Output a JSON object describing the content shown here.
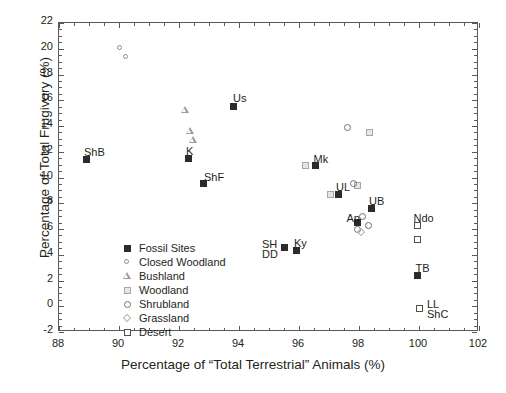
{
  "chart_data": {
    "type": "scatter",
    "title": "",
    "xlabel": "Percentage of “Total Terrestrial” Animals (%)",
    "ylabel": "Percentage of Total Frugivory (%)",
    "xlim": [
      88,
      102
    ],
    "ylim": [
      -2,
      22
    ],
    "xticks": [
      88,
      90,
      92,
      94,
      96,
      98,
      100,
      102
    ],
    "yticks": [
      -2,
      0,
      2,
      4,
      6,
      8,
      10,
      12,
      14,
      16,
      18,
      20,
      22
    ],
    "grid": false,
    "legend_position": "inside-lower-left",
    "series": [
      {
        "name": "Fossil Sites",
        "marker": "filled-square",
        "color": "#2b2b2b",
        "points": [
          {
            "label": "ShB",
            "x": 88.9,
            "y": 11.4,
            "label_dx": -2,
            "label_dy": -13
          },
          {
            "label": "K",
            "x": 92.3,
            "y": 11.5,
            "label_dx": -2,
            "label_dy": -13
          },
          {
            "label": "ShF",
            "x": 92.8,
            "y": 9.5,
            "label_dx": 1,
            "label_dy": -13
          },
          {
            "label": "Us",
            "x": 93.8,
            "y": 15.55,
            "label_dx": 0,
            "label_dy": -14
          },
          {
            "label": "SH",
            "x": 95.5,
            "y": 4.6,
            "label_dx": -22,
            "label_dy": -9
          },
          {
            "label": "DD",
            "x": 95.5,
            "y": 4.6,
            "label_dx": -22,
            "label_dy": 1
          },
          {
            "label": "Ky",
            "x": 95.9,
            "y": 4.35,
            "label_dx": -2,
            "label_dy": -13
          },
          {
            "label": "Mk",
            "x": 96.55,
            "y": 10.9,
            "label_dx": -2,
            "label_dy": -13
          },
          {
            "label": "UL",
            "x": 97.3,
            "y": 8.7,
            "label_dx": -2,
            "label_dy": -13
          },
          {
            "label": "Ap",
            "x": 97.95,
            "y": 6.5,
            "label_dx": -11,
            "label_dy": -11
          },
          {
            "label": "UB",
            "x": 98.4,
            "y": 7.6,
            "label_dx": -2,
            "label_dy": -13
          },
          {
            "label": "Ndo",
            "x": 99.95,
            "y": 6.3,
            "label_dx": -4,
            "label_dy": -13
          },
          {
            "label": "TB",
            "x": 99.95,
            "y": 2.4,
            "label_dx": -2,
            "label_dy": -13
          }
        ]
      },
      {
        "name": "Closed Woodland",
        "marker": "small-circle",
        "color": "#8d8d8d",
        "points": [
          {
            "label": "",
            "x": 90.05,
            "y": 20.0
          },
          {
            "label": "",
            "x": 90.25,
            "y": 19.35
          }
        ]
      },
      {
        "name": "Bushland",
        "marker": "triangle",
        "color": "#9a9a9a",
        "points": [
          {
            "label": "",
            "x": 92.2,
            "y": 15.25
          },
          {
            "label": "",
            "x": 92.35,
            "y": 13.6
          },
          {
            "label": "",
            "x": 92.45,
            "y": 12.9
          }
        ]
      },
      {
        "name": "Woodland",
        "marker": "small-square",
        "color": "#a6a6a6",
        "points": [
          {
            "label": "",
            "x": 96.2,
            "y": 10.95
          },
          {
            "label": "",
            "x": 97.05,
            "y": 8.65
          },
          {
            "label": "",
            "x": 97.95,
            "y": 9.4
          },
          {
            "label": "",
            "x": 98.35,
            "y": 13.5
          }
        ]
      },
      {
        "name": "Shrubland",
        "marker": "circle",
        "color": "#6f6f6f",
        "points": [
          {
            "label": "",
            "x": 97.6,
            "y": 13.85
          },
          {
            "label": "",
            "x": 97.8,
            "y": 9.5
          },
          {
            "label": "",
            "x": 98.1,
            "y": 7.0
          },
          {
            "label": "",
            "x": 98.3,
            "y": 6.3
          },
          {
            "label": "",
            "x": 97.95,
            "y": 5.95
          }
        ]
      },
      {
        "name": "Grassland",
        "marker": "diamond",
        "color": "#b5b5b5",
        "points": [
          {
            "label": "",
            "x": 98.05,
            "y": 5.75
          }
        ]
      },
      {
        "name": "Desert",
        "marker": "open-square",
        "color": "#4f4f4f",
        "points": [
          {
            "label": "",
            "x": 99.95,
            "y": 6.3
          },
          {
            "label": "",
            "x": 99.95,
            "y": 5.15
          },
          {
            "label": "LL",
            "x": 100.0,
            "y": -0.2,
            "label_dx": 8,
            "label_dy": -11
          },
          {
            "label": "ShC",
            "x": 100.0,
            "y": -0.2,
            "label_dx": 8,
            "label_dy": -1
          }
        ]
      }
    ],
    "legend_entries": [
      {
        "label": "Fossil Sites",
        "marker": "filled-square"
      },
      {
        "label": "Closed Woodland",
        "marker": "small-circle"
      },
      {
        "label": "Bushland",
        "marker": "triangle"
      },
      {
        "label": "Woodland",
        "marker": "small-square"
      },
      {
        "label": "Shrubland",
        "marker": "circle"
      },
      {
        "label": "Grassland",
        "marker": "diamond"
      },
      {
        "label": "Desert",
        "marker": "open-square"
      }
    ]
  }
}
